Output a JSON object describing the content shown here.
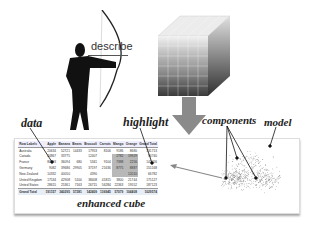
{
  "labels": {
    "describe": "describe",
    "data": "data",
    "highlight": "highlight",
    "components": "components",
    "model": "model",
    "enhanced_cube": "enhanced cube"
  },
  "table": {
    "headers": [
      "Row Labels",
      "Apple",
      "Banana",
      "Beans",
      "Broccoli",
      "Carrots",
      "Mango",
      "Orange",
      "Grand Total"
    ],
    "rows": [
      [
        "Australia",
        "20634",
        "52721",
        "14433",
        "17953",
        "8106",
        "9186",
        "8680",
        "131713"
      ],
      [
        "Canada",
        "24867",
        "33775",
        "",
        "12407",
        "",
        "2782",
        "19929",
        "94740"
      ],
      [
        "France",
        "80193",
        "36094",
        "680",
        "5341",
        "9104",
        "7388",
        "2256",
        "141056"
      ],
      [
        "Germany",
        "9082",
        "39686",
        "29905",
        "37197",
        "21636",
        "8775",
        "8887",
        "155168"
      ],
      [
        "New Zealand",
        "10332",
        "40050",
        "",
        "4390",
        "",
        "",
        "12010",
        "66782"
      ],
      [
        "United Kingdom",
        "17534",
        "42908",
        "5100",
        "38408",
        "41815",
        "3800",
        "21744",
        "175127"
      ],
      [
        "United States",
        "28615",
        "25361",
        "7163",
        "26715",
        "56284",
        "22363",
        "19552",
        "187123"
      ]
    ],
    "total": [
      "Grand Total",
      "191157",
      "340295",
      "57281",
      "142409",
      "136945",
      "57079",
      "104408",
      "1029574"
    ]
  },
  "colors": {
    "arrow": "#8a8a8a",
    "highlight_cells": "#b8b8b8",
    "cube_top": "#eeeeee",
    "cube_bottom": "#3c3c3c"
  }
}
